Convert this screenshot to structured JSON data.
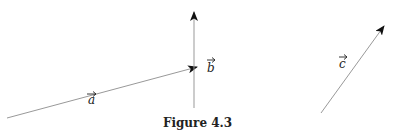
{
  "figure": {
    "caption": "Figure 4.3",
    "vectors": [
      {
        "name": "a",
        "label": "a",
        "from": [
          7,
          118
        ],
        "to": [
          197,
          67
        ]
      },
      {
        "name": "b",
        "label": "b",
        "from": [
          194,
          108
        ],
        "to": [
          194,
          12
        ]
      },
      {
        "name": "c",
        "label": "c",
        "from": [
          321,
          113
        ],
        "to": [
          384,
          26
        ]
      }
    ],
    "line_color": "#999999",
    "arrow_color": "#111111"
  }
}
